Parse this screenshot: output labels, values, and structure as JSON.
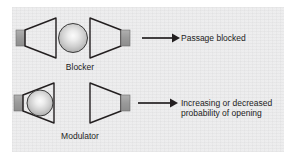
{
  "figure": {
    "panel_color": "#ececed",
    "line_color": "#231f20",
    "stub_color": "#9a9a9a",
    "text_color": "#1c1c1c"
  },
  "rows": [
    {
      "id": "blocker",
      "label": "Blocker",
      "outcome_lines": [
        "Passage blocked"
      ],
      "sphere_position": "between-cones",
      "arrow": "right-arrow"
    },
    {
      "id": "modulator",
      "label": "Modulator",
      "outcome_lines": [
        "Increasing or decreased",
        "probability of opening"
      ],
      "sphere_position": "inside-left-cone",
      "arrow": "right-arrow"
    }
  ],
  "outcomes": {
    "blocker": "Passage blocked",
    "modulator_line1": "Increasing or decreased",
    "modulator_line2": "probability of opening"
  },
  "labels": {
    "blocker": "Blocker",
    "modulator": "Modulator"
  }
}
